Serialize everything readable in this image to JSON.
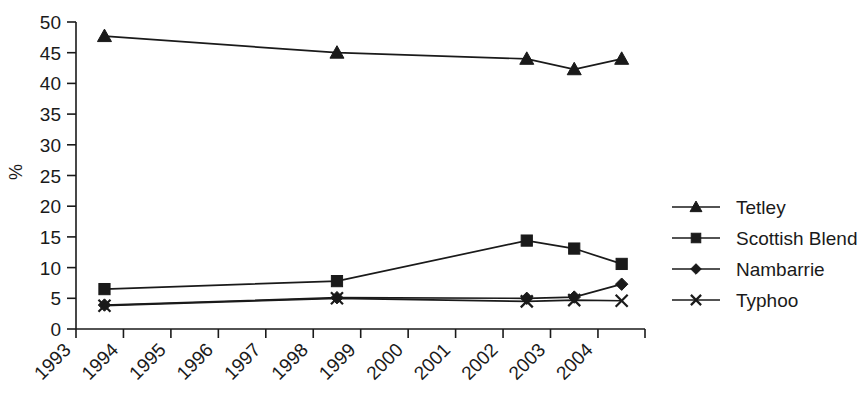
{
  "chart_data": {
    "type": "line",
    "title": "",
    "xlabel": "",
    "ylabel": "%",
    "ylim": [
      0,
      50
    ],
    "ytick_values": [
      0,
      5,
      10,
      15,
      20,
      25,
      30,
      35,
      40,
      45,
      50
    ],
    "ytick_labels": [
      "0",
      "5",
      "10",
      "15",
      "20",
      "25",
      "30",
      "35",
      "40",
      "45",
      "50"
    ],
    "xtick_labels": [
      "1993",
      "1994",
      "1995",
      "1996",
      "1997",
      "1998",
      "1999",
      "2000",
      "2001",
      "2002",
      "2003",
      "2004"
    ],
    "x_axis_years": [
      1993,
      1994,
      1995,
      1996,
      1997,
      1998,
      1999,
      2000,
      2001,
      2002,
      2003,
      2004
    ],
    "grid": false,
    "legend_position": "right",
    "series": [
      {
        "name": "Tetley",
        "marker": "triangle",
        "color": "#1a1a1a",
        "x": [
          1993.6,
          1998.5,
          2002.5,
          2003.5,
          2004.5
        ],
        "values": [
          47.7,
          45.0,
          44.0,
          42.3,
          44.0
        ]
      },
      {
        "name": "Scottish Blend",
        "marker": "square",
        "color": "#1a1a1a",
        "x": [
          1993.6,
          1998.5,
          2002.5,
          2003.5,
          2004.5
        ],
        "values": [
          6.5,
          7.8,
          14.4,
          13.1,
          10.6
        ]
      },
      {
        "name": "Nambarrie",
        "marker": "diamond",
        "color": "#1a1a1a",
        "x": [
          1993.6,
          1998.5,
          2002.5,
          2003.5,
          2004.5
        ],
        "values": [
          3.9,
          5.1,
          5.0,
          5.2,
          7.3
        ]
      },
      {
        "name": "Typhoo",
        "marker": "cross",
        "color": "#1a1a1a",
        "x": [
          1993.6,
          1998.5,
          2002.5,
          2003.5,
          2004.5
        ],
        "values": [
          3.8,
          5.0,
          4.5,
          4.7,
          4.6
        ]
      }
    ]
  },
  "legend": {
    "items": [
      {
        "label": "Tetley",
        "marker": "triangle"
      },
      {
        "label": "Scottish Blend",
        "marker": "square"
      },
      {
        "label": "Nambarrie",
        "marker": "diamond"
      },
      {
        "label": "Typhoo",
        "marker": "cross"
      }
    ]
  }
}
